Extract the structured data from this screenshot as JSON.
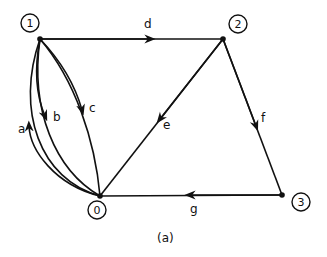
{
  "caption": "(a)",
  "nodes": [
    {
      "id": "0",
      "label": "0"
    },
    {
      "id": "1",
      "label": "1"
    },
    {
      "id": "2",
      "label": "2"
    },
    {
      "id": "3",
      "label": "3"
    }
  ],
  "edges": [
    {
      "label": "a",
      "from": "0",
      "to": "1"
    },
    {
      "label": "b",
      "from": "1",
      "to": "0"
    },
    {
      "label": "c",
      "from": "1",
      "to": "0"
    },
    {
      "label": "d",
      "from": "1",
      "to": "2"
    },
    {
      "label": "e",
      "from": "2",
      "to": "0"
    },
    {
      "label": "f",
      "from": "2",
      "to": "3"
    },
    {
      "label": "g",
      "from": "3",
      "to": "0"
    }
  ],
  "colors": {
    "stroke": "#111111",
    "background": "#ffffff"
  }
}
